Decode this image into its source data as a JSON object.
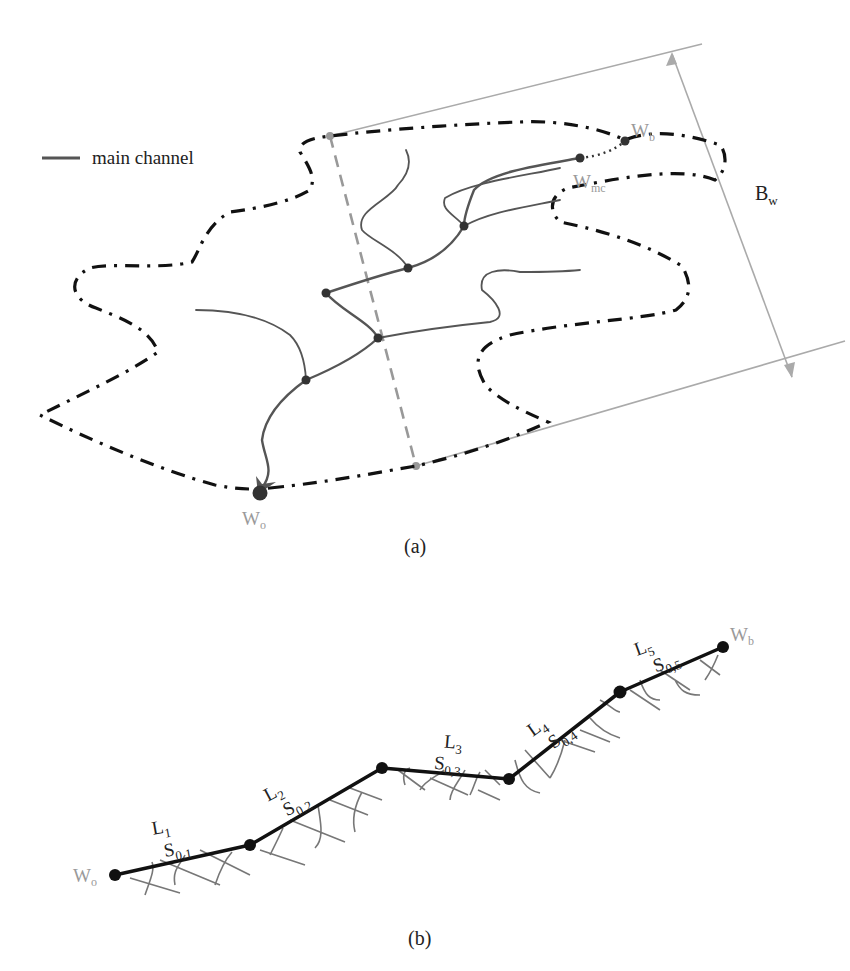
{
  "panel_a": {
    "caption": "(a)",
    "legend": {
      "label": "main channel",
      "line_color": "#555555"
    },
    "labels": {
      "outlet": "W",
      "outlet_sub": "o",
      "basin_top": "W",
      "basin_top_sub": "b",
      "main_channel_end": "W",
      "main_channel_end_sub": "mc",
      "width": "B",
      "width_sub": "w"
    },
    "colors": {
      "boundary": "#111111",
      "channel": "#555555",
      "dimension_lines": "#aaaaaa",
      "label_gray": "#9a9a9a"
    }
  },
  "panel_b": {
    "caption": "(b)",
    "start_label": "W",
    "start_sub": "o",
    "end_label": "W",
    "end_sub": "b",
    "segments": [
      {
        "L": "L",
        "L_sub": "1",
        "S": "S",
        "S_sub": "0,1"
      },
      {
        "L": "L",
        "L_sub": "2",
        "S": "S",
        "S_sub": "0,2"
      },
      {
        "L": "L",
        "L_sub": "3",
        "S": "S",
        "S_sub": "0,3"
      },
      {
        "L": "L",
        "L_sub": "4",
        "S": "S",
        "S_sub": "0,4"
      },
      {
        "L": "L",
        "L_sub": "5",
        "S": "S",
        "S_sub": "0,5"
      }
    ]
  }
}
